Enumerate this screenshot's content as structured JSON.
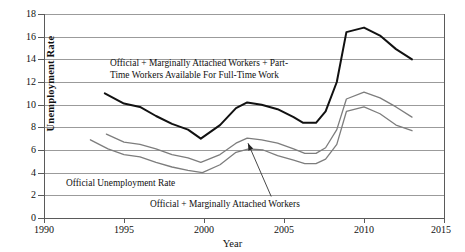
{
  "figure": {
    "ghost_header": "                                                                                                  ",
    "axis_title_y": "Unemployment Rate",
    "axis_title_x": "Year",
    "annotation_top_line1": "Official + Marginally Attached Workers + Part-",
    "annotation_top_line2": "Time Workers Available For Full-Time Work",
    "annotation_official": "Official Unemployment Rate",
    "annotation_marginal": "Official + Marginally Attached Workers"
  },
  "colors": {
    "line_u6": "#111111",
    "line_u5": "#7d7d7d",
    "line_u3": "#7d7d7d",
    "grid": "#9b9b9b",
    "axis": "#5a5a5a",
    "background": "#ffffff"
  },
  "chart_data": {
    "type": "line",
    "title": "",
    "xlabel": "Year",
    "ylabel": "Unemployment Rate",
    "xlim": [
      1990,
      2015
    ],
    "ylim": [
      0,
      18
    ],
    "xticks": [
      1990,
      1995,
      2000,
      2005,
      2010,
      2015
    ],
    "yticks": [
      0,
      2,
      4,
      6,
      8,
      10,
      12,
      14,
      16,
      18
    ],
    "grid": "horizontal",
    "legend": "annotations-inline",
    "series": [
      {
        "name": "Official + Marginally Attached Workers + Part-Time Workers Available For Full-Time Work",
        "short": "U-6",
        "color": "#111111",
        "width": 2.0,
        "x": [
          1993.8,
          1995.0,
          1996.0,
          1997.0,
          1998.0,
          1999.0,
          1999.8,
          2001.0,
          2002.0,
          2002.7,
          2003.6,
          2004.6,
          2005.6,
          2006.2,
          2007.0,
          2007.6,
          2008.3,
          2008.9,
          2010.0,
          2011.0,
          2012.0,
          2013.0
        ],
        "y": [
          11.0,
          10.1,
          9.8,
          9.0,
          8.3,
          7.8,
          7.0,
          8.2,
          9.7,
          10.2,
          10.0,
          9.6,
          8.9,
          8.4,
          8.4,
          9.4,
          12.0,
          16.4,
          16.8,
          16.1,
          14.9,
          14.0
        ]
      },
      {
        "name": "Official + Marginally Attached Workers",
        "short": "U-5",
        "color": "#7d7d7d",
        "width": 1.3,
        "x": [
          1993.9,
          1995.0,
          1996.0,
          1997.0,
          1998.0,
          1999.0,
          1999.8,
          2001.0,
          2002.0,
          2002.7,
          2003.6,
          2004.6,
          2005.6,
          2006.3,
          2007.0,
          2007.6,
          2008.3,
          2008.9,
          2010.0,
          2011.0,
          2012.0,
          2013.0
        ],
        "y": [
          7.4,
          6.7,
          6.5,
          6.1,
          5.6,
          5.3,
          4.9,
          5.6,
          6.6,
          7.05,
          6.9,
          6.6,
          6.1,
          5.7,
          5.7,
          6.2,
          7.8,
          10.5,
          11.1,
          10.6,
          9.8,
          8.9
        ]
      },
      {
        "name": "Official Unemployment Rate",
        "short": "U-3",
        "color": "#7d7d7d",
        "width": 1.3,
        "x": [
          1992.9,
          1994.0,
          1995.0,
          1996.0,
          1997.0,
          1998.0,
          1999.0,
          1999.9,
          2001.0,
          2002.0,
          2002.8,
          2003.7,
          2004.6,
          2005.6,
          2006.3,
          2007.0,
          2007.6,
          2008.3,
          2008.9,
          2010.0,
          2011.0,
          2012.0,
          2013.0
        ],
        "y": [
          6.9,
          6.1,
          5.6,
          5.4,
          4.9,
          4.5,
          4.2,
          4.0,
          4.7,
          5.8,
          6.1,
          6.0,
          5.5,
          5.1,
          4.8,
          4.8,
          5.2,
          6.5,
          9.4,
          9.8,
          9.2,
          8.2,
          7.7
        ]
      }
    ],
    "annotations": [
      {
        "text": "Official + Marginally Attached Workers + Part-Time Workers Available For Full-Time Work",
        "target_series": "U-6",
        "position": "upper-center"
      },
      {
        "text": "Official Unemployment Rate",
        "target_series": "U-3",
        "position": "lower-left"
      },
      {
        "text": "Official + Marginally Attached Workers",
        "target_series": "U-5",
        "position": "lower-center",
        "leader": {
          "from_x": 2004.2,
          "from_y": 1.9,
          "to_x": 2002.75,
          "to_y": 6.6,
          "arrow": true
        }
      }
    ]
  }
}
